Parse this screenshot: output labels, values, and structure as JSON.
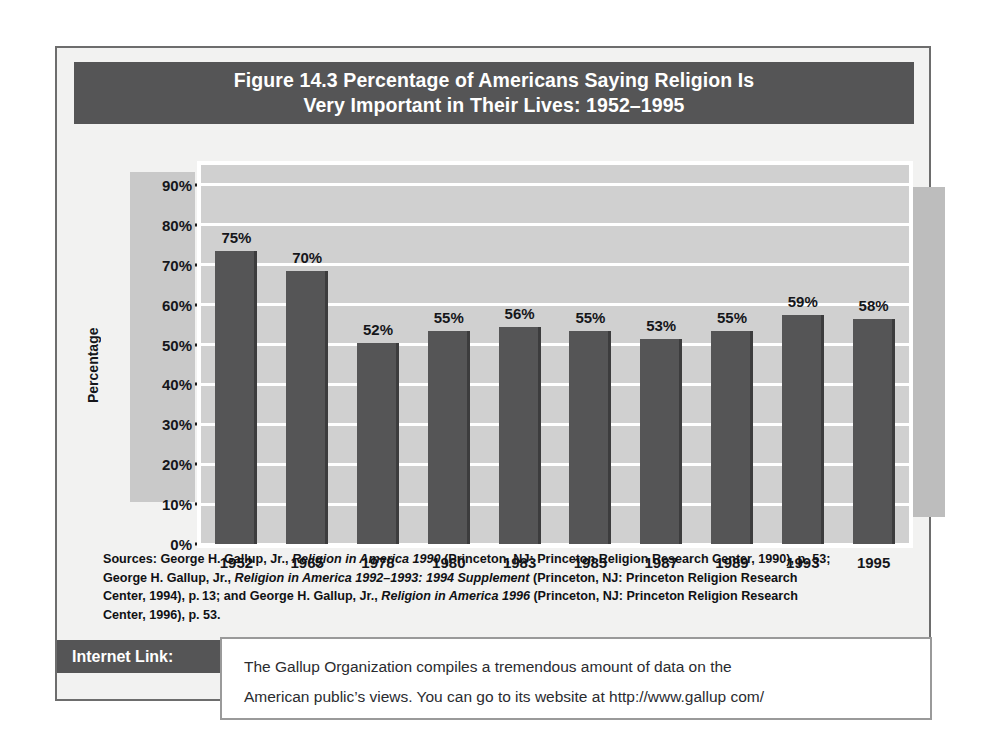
{
  "figure": {
    "title_line1": "Figure 14.3  Percentage of Americans Saying Religion Is",
    "title_line2": "Very Important in Their Lives: 1952–1995",
    "y_axis_title": "Percentage"
  },
  "chart_data": {
    "type": "bar",
    "title": "Figure 14.3  Percentage of Americans Saying Religion Is Very Important in Their Lives: 1952–1995",
    "xlabel": "",
    "ylabel": "Percentage",
    "categories": [
      "1952",
      "1965",
      "1978",
      "1980",
      "1983",
      "1985",
      "1987",
      "1989",
      "1993",
      "1995"
    ],
    "values": [
      75,
      70,
      52,
      55,
      56,
      55,
      53,
      55,
      59,
      58
    ],
    "value_labels": [
      "75%",
      "70%",
      "52%",
      "55%",
      "56%",
      "55%",
      "53%",
      "55%",
      "59%",
      "58%"
    ],
    "ylim": [
      0,
      95
    ],
    "yticks": [
      0,
      10,
      20,
      30,
      40,
      50,
      60,
      70,
      80,
      90
    ],
    "ytick_labels": [
      "0%",
      "10%",
      "20%",
      "30%",
      "40%",
      "50%",
      "60%",
      "70%",
      "80%",
      "90%"
    ],
    "grid": true,
    "legend": null,
    "bar_color": "#555556",
    "plot_background": "#d0d0d0",
    "gridline_color": "#ffffff"
  },
  "sources": {
    "lines": [
      [
        {
          "t": "Sources: George H. Gallup, Jr., ",
          "i": false
        },
        {
          "t": "Religion in America 1990",
          "i": true
        },
        {
          "t": " (Princeton, NJ: Princeton Religion Research Center, 1990), p. 53;",
          "i": false
        }
      ],
      [
        {
          "t": "George H. Gallup, Jr., ",
          "i": false
        },
        {
          "t": "Religion in America 1992–1993: 1994 Supplement",
          "i": true
        },
        {
          "t": " (Princeton, NJ: Princeton Religion Research",
          "i": false
        }
      ],
      [
        {
          "t": "Center, 1994), p. 13; and George H. Gallup, Jr., ",
          "i": false
        },
        {
          "t": "Religion in America 1996",
          "i": true
        },
        {
          "t": " (Princeton, NJ: Princeton Religion Research",
          "i": false
        }
      ],
      [
        {
          "t": "Center, 1996), p. 53.",
          "i": false
        }
      ]
    ]
  },
  "internet_link": {
    "tag_label": "Internet Link:",
    "line1": "The Gallup Organization compiles a tremendous amount of data on the",
    "line2": "American public’s views. You can go to its website at http://www.gallup com/"
  },
  "colors": {
    "banner": "#555556",
    "bar": "#555556",
    "plot_bg": "#d0d0d0",
    "card_bg": "#f2f2f1",
    "card_border": "#6d6d6d"
  }
}
